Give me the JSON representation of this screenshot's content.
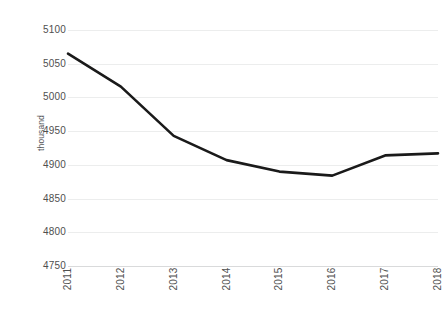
{
  "chart_data": {
    "type": "line",
    "title": "",
    "subtitle": "",
    "xlabel": "",
    "ylabel": "thousand",
    "categories": [
      "2011",
      "2012",
      "2013",
      "2014",
      "2015",
      "2016",
      "2017",
      "2018"
    ],
    "values": [
      5065,
      5016,
      4943,
      4907,
      4890,
      4884,
      4914,
      4917
    ],
    "series": [
      {
        "name": "",
        "values": [
          5065,
          5016,
          4943,
          4907,
          4890,
          4884,
          4914,
          4917
        ]
      }
    ],
    "ylim": [
      4750,
      5100
    ],
    "ytick_step": 50,
    "yticks": [
      5100,
      5050,
      5000,
      4950,
      4900,
      4850,
      4800,
      4750
    ],
    "ytick_labels": [
      "5100",
      "5050",
      "5000",
      "4950",
      "4900",
      "4850",
      "4800",
      "4750"
    ],
    "xtick_labels": [
      "2011",
      "2012",
      "2013",
      "2014",
      "2015",
      "2016",
      "2017",
      "2018"
    ],
    "xtick_rotation": -90,
    "grid": true,
    "grid_axis": "y",
    "legend": false,
    "legend_position": "none",
    "markers": false,
    "annotations": []
  },
  "style": {
    "line_color": "#1a1a1a",
    "line_width": 2.6,
    "grid_color": "#eceded",
    "axis_color": "#d9dadb",
    "tick_text_color": "#4f4f4f",
    "axis_title_color": "#58595b",
    "background": "#ffffff"
  }
}
